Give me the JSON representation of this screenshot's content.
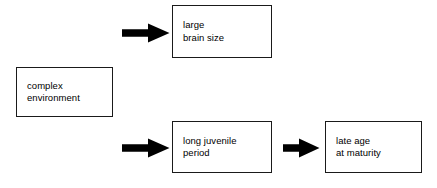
{
  "diagram": {
    "colors": {
      "box_border": "#1a1a1a",
      "box_fill": "#ffffff",
      "arrow_fill": "#000000",
      "text": "#000000",
      "background": "#ffffff"
    },
    "nodes": [
      {
        "id": "complex-environment",
        "lines": [
          "complex",
          "environment"
        ]
      },
      {
        "id": "large-brain-size",
        "lines": [
          "large",
          "brain size"
        ]
      },
      {
        "id": "long-juvenile-period",
        "lines": [
          "long juvenile",
          "period"
        ]
      },
      {
        "id": "late-age-at-maturity",
        "lines": [
          "late age",
          "at maturity"
        ]
      }
    ],
    "arrows": [
      {
        "id": "to-large-brain-size",
        "icon": "arrow-right-icon",
        "from": "complex-environment",
        "to": "large-brain-size"
      },
      {
        "id": "to-long-juvenile-period",
        "icon": "arrow-right-icon",
        "from": "complex-environment",
        "to": "long-juvenile-period"
      },
      {
        "id": "juvenile-period-to-late-age",
        "icon": "arrow-right-icon",
        "from": "long-juvenile-period",
        "to": "late-age-at-maturity"
      }
    ]
  }
}
